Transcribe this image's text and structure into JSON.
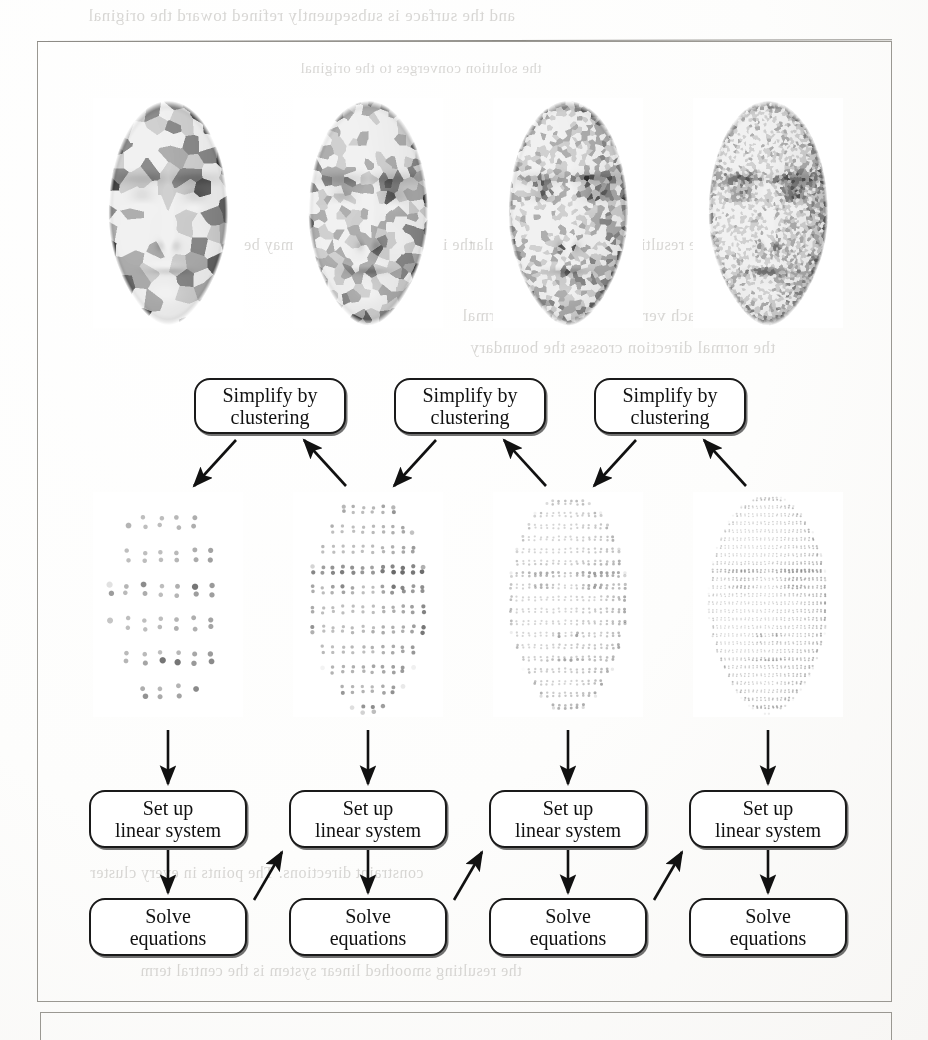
{
  "figure": {
    "type": "pipeline-diagram",
    "columns": 4,
    "rows": [
      {
        "name": "shaded-face-meshes",
        "label": "Shaded face meshes at increasing resolution"
      },
      {
        "name": "simplify-step",
        "label": "Simplify by clustering"
      },
      {
        "name": "point-cloud-faces",
        "label": "Point sampled face surfaces"
      },
      {
        "name": "setup-step",
        "label": "Set up linear system"
      },
      {
        "name": "solve-step",
        "label": "Solve equations"
      }
    ]
  },
  "faces_top": [
    {
      "id": "face-lod-0",
      "label": "coarse clustered face",
      "cluster_scale": 15,
      "contrast": 1.0
    },
    {
      "id": "face-lod-1",
      "label": "medium clustered face",
      "cluster_scale": 9,
      "contrast": 0.95
    },
    {
      "id": "face-lod-2",
      "label": "fine clustered face",
      "cluster_scale": 5,
      "contrast": 0.85
    },
    {
      "id": "face-lod-3",
      "label": "finest clustered face",
      "cluster_scale": 3,
      "contrast": 0.7
    }
  ],
  "faces_points": [
    {
      "id": "points-lod-0",
      "label": "sparse point cloud face",
      "spacing": 17,
      "dot": 3.1
    },
    {
      "id": "points-lod-1",
      "label": "medium point cloud face",
      "spacing": 10,
      "dot": 2.2
    },
    {
      "id": "points-lod-2",
      "label": "dense point cloud face",
      "spacing": 6,
      "dot": 1.5
    },
    {
      "id": "points-lod-3",
      "label": "very dense point cloud face",
      "spacing": 4,
      "dot": 1.05
    }
  ],
  "boxes": {
    "simplify": {
      "line1": "Simplify by",
      "line2": "clustering",
      "count": 3
    },
    "setup": {
      "line1": "Set up",
      "line2": "linear system",
      "count": 4
    },
    "solve": {
      "line1": "Solve",
      "line2": "equations",
      "count": 4
    }
  },
  "arrows": {
    "down_from_points": 4,
    "diagonal_into_simplify": 6,
    "diagonal_setup_to_setup": 3,
    "down_setup_to_solve": 4
  },
  "colors": {
    "frame": "#9a9892",
    "box_border": "#1a1a1a",
    "box_fill": "#ffffff",
    "arrow": "#111111",
    "ink": "#111111",
    "page": "#fdfdfc",
    "ghost_text": "#b9b7b3"
  },
  "ghost_text": [
    {
      "id": "gt-top",
      "text": "and the surface is subsequently refined toward the original",
      "x": 88,
      "y": 6,
      "size": 17
    },
    {
      "id": "gt-a",
      "text": "the interpolation problem may be stated as",
      "x": 180,
      "y": 236,
      "size": 16
    },
    {
      "id": "gt-b",
      "text": "where the resulting system is nonsingular",
      "x": 470,
      "y": 236,
      "size": 16
    },
    {
      "id": "gt-c",
      "text": "surface. For each vertex of the mesh a normal",
      "x": 462,
      "y": 306,
      "size": 17
    },
    {
      "id": "gt-d",
      "text": "the normal direction crosses the boundary",
      "x": 470,
      "y": 338,
      "size": 17
    },
    {
      "id": "gt-e",
      "text": "constraint directions. The points in every cluster",
      "x": 90,
      "y": 864,
      "size": 16
    },
    {
      "id": "gt-f",
      "text": "the resulting smoothed linear system is the central term",
      "x": 140,
      "y": 962,
      "size": 16
    },
    {
      "id": "gt-g",
      "text": "the solution converges to the original",
      "x": 300,
      "y": 60,
      "size": 15
    }
  ]
}
